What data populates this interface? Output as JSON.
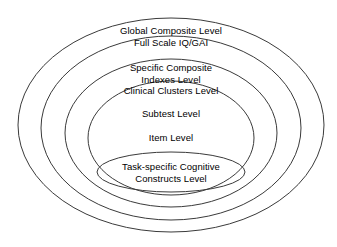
{
  "diagram": {
    "type": "nested-ellipses",
    "background_color": "#ffffff",
    "stroke_color": "#3a3a3a",
    "text_color": "#000000",
    "center": {
      "x": 171,
      "y": 125
    },
    "levels": [
      {
        "id": "global-composite",
        "order": 1,
        "position": "outermost",
        "lines": [
          "Global Composite Level",
          "Full Scale IQ/GAI"
        ],
        "line_1": "Global Composite Level",
        "line_2": "Full Scale IQ/GAI",
        "ellipse": {
          "cx": 171,
          "cy": 125,
          "rx": 153,
          "ry": 107
        },
        "label_anchor": {
          "x": 171,
          "y": 25
        }
      },
      {
        "id": "specific-composite",
        "order": 2,
        "position": "second",
        "lines": [
          "Specific Composite",
          "Indexes Level",
          "Clinical Clusters Level"
        ],
        "line_1": "Specific Composite",
        "line_2": "Indexes Level",
        "line_3": "Clinical Clusters Level",
        "ellipse": {
          "cx": 171,
          "cy": 128,
          "rx": 130,
          "ry": 92
        },
        "label_anchor": {
          "x": 171,
          "y": 62
        }
      },
      {
        "id": "subtest",
        "order": 3,
        "position": "third",
        "lines": [
          "Subtest Level"
        ],
        "line_1": "Subtest Level",
        "ellipse": {
          "cx": 171,
          "cy": 133,
          "rx": 106,
          "ry": 74
        },
        "label_anchor": {
          "x": 171,
          "y": 108
        }
      },
      {
        "id": "item",
        "order": 4,
        "position": "fourth",
        "lines": [
          "Item Level"
        ],
        "line_1": "Item Level",
        "ellipse": {
          "cx": 171,
          "cy": 138,
          "rx": 83,
          "ry": 57
        },
        "label_anchor": {
          "x": 171,
          "y": 132
        }
      },
      {
        "id": "task-specific-constructs",
        "order": 5,
        "position": "innermost",
        "lines": [
          "Task-specific Cognitive",
          "Constructs Level"
        ],
        "line_1": "Task-specific Cognitive",
        "line_2": "Constructs Level",
        "ellipse": {
          "cx": 171,
          "cy": 172,
          "rx": 74,
          "ry": 20
        },
        "label_anchor": {
          "x": 171,
          "y": 161
        }
      }
    ]
  }
}
